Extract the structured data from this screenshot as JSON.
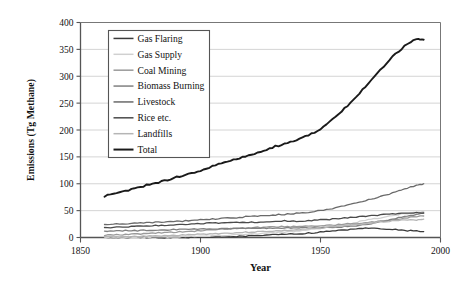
{
  "chart_data": {
    "type": "line",
    "title": "",
    "xlabel": "Year",
    "ylabel": "Emissions (Tg Methane)",
    "xlim": [
      1850,
      2000
    ],
    "ylim": [
      0,
      400
    ],
    "xticks": [
      1850,
      1900,
      1950,
      2000
    ],
    "yticks": [
      0,
      50,
      100,
      150,
      200,
      250,
      300,
      350,
      400
    ],
    "grid": "horizontal",
    "legend_position": "upper-left-inside",
    "x": [
      1860,
      1865,
      1870,
      1875,
      1880,
      1885,
      1890,
      1895,
      1900,
      1905,
      1910,
      1915,
      1920,
      1925,
      1930,
      1935,
      1940,
      1945,
      1950,
      1955,
      1960,
      1965,
      1970,
      1975,
      1980,
      1985,
      1990,
      1993
    ],
    "series": [
      {
        "name": "Gas Flaring",
        "color": "#3a3a3a",
        "values": [
          0,
          0,
          0,
          0,
          0,
          0,
          0,
          0,
          1,
          1,
          2,
          2,
          3,
          4,
          5,
          6,
          7,
          8,
          10,
          12,
          14,
          16,
          18,
          17,
          15,
          13,
          12,
          11
        ]
      },
      {
        "name": "Gas Supply",
        "color": "#d0d0d0",
        "values": [
          0,
          0,
          0,
          0,
          1,
          1,
          1,
          2,
          2,
          3,
          4,
          5,
          6,
          7,
          9,
          10,
          12,
          14,
          17,
          20,
          24,
          28,
          33,
          37,
          41,
          44,
          47,
          48
        ]
      },
      {
        "name": "Coal Mining",
        "color": "#9a9a9a",
        "values": [
          4,
          5,
          6,
          7,
          8,
          9,
          10,
          11,
          13,
          14,
          16,
          17,
          18,
          19,
          20,
          20,
          21,
          21,
          22,
          23,
          25,
          26,
          28,
          30,
          33,
          36,
          39,
          40
        ]
      },
      {
        "name": "Biomass Burning",
        "color": "#808080",
        "values": [
          12,
          12,
          13,
          13,
          14,
          14,
          15,
          15,
          16,
          16,
          16,
          17,
          17,
          17,
          17,
          18,
          18,
          18,
          18,
          19,
          20,
          22,
          25,
          29,
          34,
          39,
          43,
          45
        ]
      },
      {
        "name": "Livestock",
        "color": "#6a6a6a",
        "values": [
          24,
          25,
          26,
          27,
          28,
          29,
          30,
          31,
          33,
          34,
          36,
          37,
          39,
          40,
          42,
          43,
          45,
          47,
          50,
          54,
          59,
          64,
          70,
          76,
          83,
          90,
          97,
          100
        ]
      },
      {
        "name": "Rice etc.",
        "color": "#4a4a4a",
        "values": [
          18,
          19,
          20,
          21,
          22,
          23,
          24,
          25,
          26,
          27,
          27,
          28,
          28,
          29,
          30,
          31,
          30,
          31,
          33,
          34,
          36,
          38,
          40,
          42,
          44,
          45,
          46,
          46
        ]
      },
      {
        "name": "Landfills",
        "color": "#b5b5b5",
        "values": [
          1,
          1,
          2,
          2,
          3,
          3,
          4,
          5,
          6,
          7,
          8,
          9,
          10,
          11,
          12,
          13,
          14,
          16,
          18,
          20,
          22,
          24,
          27,
          29,
          31,
          32,
          33,
          34
        ]
      },
      {
        "name": "Total",
        "color": "#1a1a1a",
        "values": [
          77,
          82,
          88,
          94,
          100,
          106,
          112,
          118,
          125,
          132,
          140,
          146,
          152,
          160,
          168,
          174,
          182,
          190,
          202,
          220,
          240,
          262,
          288,
          312,
          336,
          356,
          370,
          368
        ]
      }
    ]
  },
  "axes": {
    "ylabel": "Emissions (Tg Methane)",
    "xlabel": "Year",
    "ytick_labels": [
      "400",
      "350",
      "300",
      "250",
      "200",
      "150",
      "100",
      "50",
      "0"
    ],
    "xtick_labels": [
      "1850",
      "1900",
      "1950",
      "2000"
    ]
  },
  "legend": {
    "items": [
      {
        "label": "Gas Flaring"
      },
      {
        "label": "Gas Supply"
      },
      {
        "label": "Coal Mining"
      },
      {
        "label": "Biomass Burning"
      },
      {
        "label": "Livestock"
      },
      {
        "label": "Rice etc."
      },
      {
        "label": "Landfills"
      },
      {
        "label": "Total"
      }
    ]
  }
}
